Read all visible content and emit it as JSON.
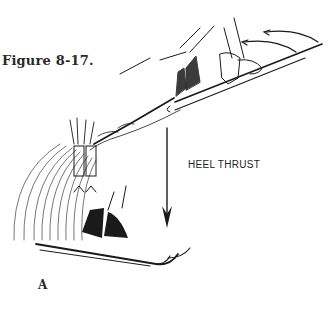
{
  "figure": {
    "caption": "Figure 8-17.",
    "panel_label": "A",
    "annotation": "HEEL THRUST",
    "illustration": "skier-heel-thrust-sequence",
    "colors": {
      "ink": "#1a1a1a",
      "background": "#ffffff"
    }
  }
}
